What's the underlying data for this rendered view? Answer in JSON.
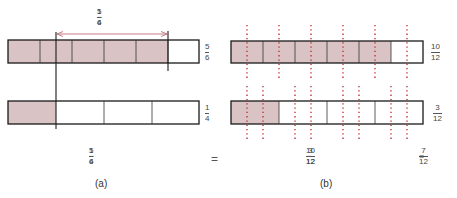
{
  "colors": {
    "shade": "#d9c3c4",
    "outline": "#1a1a1a",
    "divider": "#333333",
    "dotted": "#c0323a",
    "arrow": "#c0707a"
  },
  "panel_a": {
    "caption": "(a)",
    "top_bar": {
      "parts": 6,
      "shaded": 5,
      "label": {
        "num": "5",
        "den": "6"
      }
    },
    "bottom_bar": {
      "parts": 4,
      "shaded": 1,
      "label": {
        "num": "1",
        "den": "4"
      }
    },
    "arrow_label": {
      "a_num": "5",
      "a_den": "6",
      "op": "−",
      "b_num": "1",
      "b_den": "4"
    },
    "expression": {
      "a_num": "5",
      "a_den": "6",
      "op": "−",
      "b_num": "1",
      "b_den": "4"
    }
  },
  "equals": "=",
  "panel_b": {
    "caption": "(b)",
    "top_bar": {
      "parts": 6,
      "shaded": 5,
      "subdivisions": 12,
      "label": {
        "num": "10",
        "den": "12"
      }
    },
    "bottom_bar": {
      "parts": 4,
      "shaded": 1,
      "subdivisions": 12,
      "label": {
        "num": "3",
        "den": "12"
      }
    },
    "expression": {
      "a_num": "10",
      "a_den": "12",
      "op": "−",
      "b_num": "3",
      "b_den": "12"
    },
    "result": {
      "eq": "=",
      "num": "7",
      "den": "12"
    }
  }
}
